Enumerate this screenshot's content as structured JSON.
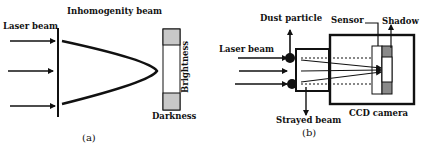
{
  "panel_a": {
    "title": "Inhomogenity beam",
    "laser_label": "Laser beam",
    "brightness_label": "Brightness",
    "darkness_label": "Darkness",
    "caption": "(a)"
  },
  "panel_b": {
    "dust_label": "Dust particle",
    "sensor_label": "Sensor",
    "shadow_label": "Shadow",
    "laser_label": "Laser beam",
    "strayed_label": "Strayed beam",
    "camera_label": "CCD camera",
    "caption": "(b)"
  },
  "colors": {
    "line": "#111111",
    "shade": "#c8c8c8",
    "shadow": "#8a8a8a"
  }
}
